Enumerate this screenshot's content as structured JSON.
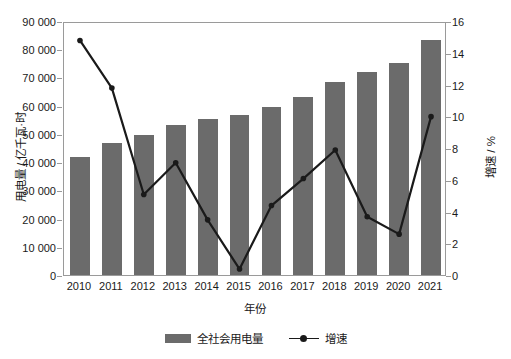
{
  "chart_data": {
    "type": "bar",
    "title": "",
    "xlabel": "年份",
    "ylabel": "用电量 / 亿千瓦·时",
    "y2label": "增速 / %",
    "categories": [
      "2010",
      "2011",
      "2012",
      "2013",
      "2014",
      "2015",
      "2016",
      "2017",
      "2018",
      "2019",
      "2020",
      "2021"
    ],
    "ylim": [
      0,
      90000
    ],
    "y2lim": [
      0,
      16
    ],
    "yticks": [
      "0",
      "10 000",
      "20 000",
      "30 000",
      "40 000",
      "50 000",
      "60 000",
      "70 000",
      "80 000",
      "90 000"
    ],
    "ytick_values": [
      0,
      10000,
      20000,
      30000,
      40000,
      50000,
      60000,
      70000,
      80000,
      90000
    ],
    "y2ticks": [
      "0",
      "2",
      "4",
      "6",
      "8",
      "10",
      "12",
      "14",
      "16"
    ],
    "y2tick_values": [
      0,
      2,
      4,
      6,
      8,
      10,
      12,
      14,
      16
    ],
    "grid": false,
    "legend_position": "bottom",
    "series": [
      {
        "name": "全社会用电量",
        "type": "bar",
        "axis": "left",
        "color": "#6b6b6b",
        "values": [
          41900,
          46900,
          49600,
          53200,
          55400,
          56800,
          59400,
          63100,
          68500,
          72000,
          75100,
          83100
        ]
      },
      {
        "name": "增速",
        "type": "line",
        "axis": "right",
        "color": "#1a1a1a",
        "values": [
          14.9,
          11.9,
          5.2,
          7.2,
          3.6,
          0.5,
          4.5,
          6.2,
          8.0,
          3.8,
          2.7,
          10.1
        ]
      }
    ]
  },
  "legend": {
    "items": [
      {
        "label": "全社会用电量",
        "marker": "bar-swatch-icon"
      },
      {
        "label": "增速",
        "marker": "line-marker-icon"
      }
    ]
  }
}
